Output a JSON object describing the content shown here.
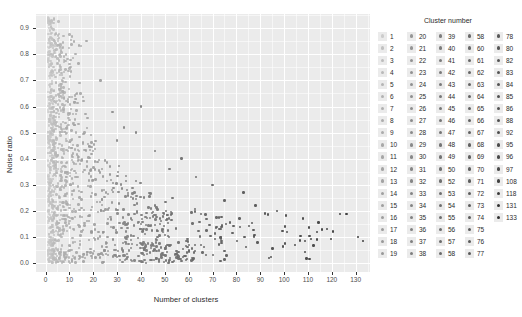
{
  "chart_data": {
    "type": "scatter",
    "title": "",
    "xlabel": "Number of clusters",
    "ylabel": "Noise ratio",
    "xlim": [
      -4,
      136
    ],
    "ylim": [
      -0.035,
      0.955
    ],
    "x_ticks": [
      0,
      10,
      20,
      30,
      40,
      50,
      60,
      70,
      80,
      90,
      100,
      110,
      120,
      130
    ],
    "x_tick_labels": [
      "0",
      "10",
      "20",
      "30",
      "40",
      "50",
      "60",
      "70",
      "80",
      "90",
      "100",
      "110",
      "120",
      "130"
    ],
    "y_ticks": [
      0.0,
      0.1,
      0.2,
      0.3,
      0.4,
      0.5,
      0.6,
      0.7,
      0.8,
      0.9
    ],
    "y_tick_labels": [
      "0.0",
      "0.1",
      "0.2",
      "0.3",
      "0.4",
      "0.5",
      "0.6",
      "0.7",
      "0.8",
      "0.9"
    ],
    "grid": true,
    "panel_background": "#ebebeb",
    "grid_color": "#ffffff",
    "legend_position": "right",
    "legend_title": "Cluster number",
    "color_scale": {
      "type": "sequential-grey",
      "low": "#cccccc",
      "high": "#303030",
      "mapped_variable": "Cluster number",
      "domain": [
        1,
        133
      ]
    },
    "point_size": 2.4,
    "n_points": 1180,
    "legend_entries": [
      [
        1,
        2,
        3,
        4,
        5,
        6,
        7,
        8,
        9,
        10,
        11,
        12,
        13,
        14,
        15,
        16,
        17,
        18,
        19
      ],
      [
        20,
        21,
        22,
        23,
        24,
        25,
        26,
        27,
        28,
        29,
        30,
        31,
        32,
        33,
        34,
        35,
        36,
        37,
        38
      ],
      [
        39,
        40,
        41,
        42,
        43,
        44,
        45,
        46,
        47,
        48,
        49,
        50,
        52,
        53,
        54,
        55,
        56,
        57,
        58
      ],
      [
        58,
        60,
        61,
        62,
        63,
        64,
        65,
        66,
        67,
        68,
        69,
        70,
        71,
        72,
        73,
        74,
        75,
        76,
        77
      ],
      [
        78,
        80,
        82,
        83,
        84,
        85,
        86,
        88,
        92,
        95,
        96,
        97,
        108,
        118,
        131,
        133
      ]
    ],
    "legend_columns": [
      {
        "values": [
          1,
          2,
          3,
          4,
          5,
          6,
          7,
          8,
          9,
          10,
          11,
          12,
          13,
          14,
          15,
          16,
          17,
          18,
          19
        ]
      },
      {
        "values": [
          20,
          21,
          22,
          23,
          24,
          25,
          26,
          27,
          28,
          29,
          30,
          31,
          32,
          33,
          34,
          35,
          36,
          37,
          38
        ]
      },
      {
        "values": [
          39,
          40,
          41,
          42,
          43,
          44,
          45,
          46,
          47,
          48,
          49,
          50,
          52,
          53,
          54,
          55,
          56,
          57,
          58
        ]
      },
      {
        "values": [
          58,
          60,
          61,
          62,
          63,
          64,
          65,
          66,
          67,
          68,
          69,
          70,
          71,
          72,
          73,
          74,
          75,
          76,
          77
        ]
      },
      {
        "values": [
          78,
          80,
          82,
          83,
          84,
          85,
          86,
          88,
          92,
          95,
          96,
          97,
          108,
          118,
          131,
          133
        ]
      }
    ]
  }
}
